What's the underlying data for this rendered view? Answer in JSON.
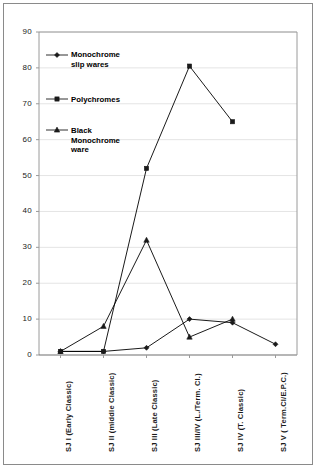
{
  "chart_data": {
    "type": "line",
    "title": "",
    "subtitle": "",
    "xlabel": "",
    "ylabel": "",
    "ylim": [
      0,
      90
    ],
    "ytick_labels": [
      "0",
      "10",
      "20",
      "30",
      "40",
      "50",
      "60",
      "70",
      "80",
      "90"
    ],
    "yticks": [
      0,
      10,
      20,
      30,
      40,
      50,
      60,
      70,
      80,
      90
    ],
    "grid": true,
    "grid_axis": "y",
    "legend_position": "inside-top-left",
    "categories": [
      "SJ I (Early Classic)",
      "SJ II (middle Classic)",
      "SJ III (Late Classic)",
      "SJ III/IV (L./Term. Cl.)",
      "SJ IV (T. Classic)",
      "SJ V ( Term.Cl/E.P.C.)"
    ],
    "series": [
      {
        "name": "Monochrome slip wares",
        "marker": "diamond",
        "color": "#000000",
        "values": [
          1,
          1,
          2,
          10,
          9,
          3
        ]
      },
      {
        "name": "Polychromes",
        "marker": "square",
        "color": "#000000",
        "values": [
          1,
          1,
          52,
          80.5,
          65,
          null
        ]
      },
      {
        "name": "Black Monochrome ware",
        "marker": "triangle",
        "color": "#000000",
        "values": [
          1,
          8,
          32,
          5,
          10,
          null
        ]
      }
    ]
  },
  "legend": {
    "entries": [
      {
        "label": "Monochrome\nslip wares",
        "marker": "diamond"
      },
      {
        "label": "Polychromes",
        "marker": "square"
      },
      {
        "label": "Black\nMonochrome\nware",
        "marker": "triangle"
      }
    ]
  },
  "colors": {
    "line": "#1a1a1a",
    "grid": "#e4e4e4",
    "axis": "#9a9a9a",
    "frame": "#8a8a8a",
    "text": "#111111",
    "background": "#ffffff"
  }
}
